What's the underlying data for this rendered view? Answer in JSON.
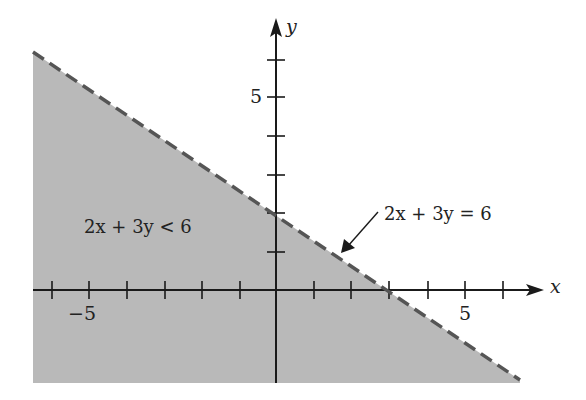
{
  "diagram": {
    "type": "linear-inequality-graph",
    "axes": {
      "x_label": "x",
      "y_label": "y",
      "x_tick_labels": [
        {
          "value": -5,
          "text": "−5"
        },
        {
          "value": 5,
          "text": "5"
        }
      ],
      "y_tick_labels": [
        {
          "value": 5,
          "text": "5"
        }
      ],
      "x_ticks": [
        -6,
        -5,
        -4,
        -3,
        -2,
        -1,
        1,
        2,
        3,
        4,
        5,
        6
      ],
      "y_ticks": [
        1,
        2,
        3,
        4,
        5,
        6
      ]
    },
    "boundary_line": {
      "equation": "2x + 3y = 6",
      "style": "dashed",
      "label": "2x + 3y = 6"
    },
    "region": {
      "inequality": "2x + 3y < 6",
      "label": "2x + 3y < 6",
      "fill_color": "#b9b9b9"
    },
    "colors": {
      "axis": "#1a1a1a",
      "boundary": "#555555",
      "shade": "#b9b9b9"
    }
  }
}
